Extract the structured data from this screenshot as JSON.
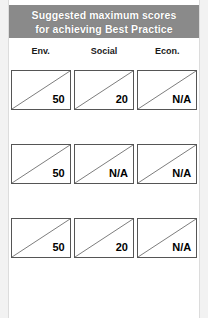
{
  "title": {
    "line1": "Suggested maximum scores",
    "line2": "for achieving Best Practice",
    "background_color": "#8a8a8a",
    "text_color": "#ffffff"
  },
  "columns": [
    {
      "label": "Env."
    },
    {
      "label": "Social"
    },
    {
      "label": "Econ."
    }
  ],
  "rows": [
    {
      "cells": [
        {
          "value": "50"
        },
        {
          "value": "20"
        },
        {
          "value": "N/A"
        }
      ]
    },
    {
      "cells": [
        {
          "value": "50"
        },
        {
          "value": "N/A"
        },
        {
          "value": "N/A"
        }
      ]
    },
    {
      "cells": [
        {
          "value": "50"
        },
        {
          "value": "20"
        },
        {
          "value": "N/A"
        }
      ]
    }
  ]
}
